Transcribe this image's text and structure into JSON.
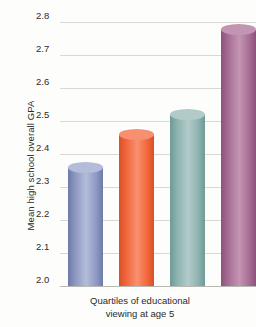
{
  "chart_data": {
    "type": "bar",
    "title": "",
    "xlabel": "Quartiles of educational viewing at age 5",
    "xlabel_line1": "Quartiles of educational",
    "xlabel_line2": "viewing at age 5",
    "ylabel": "Mean high school overall GPA",
    "categories": [
      "1",
      "2",
      "3",
      "4"
    ],
    "values": [
      2.36,
      2.46,
      2.52,
      2.78
    ],
    "ylim": [
      2.0,
      2.8
    ],
    "ytick_labels": [
      "2.8",
      "2.7",
      "2.6",
      "2.5",
      "2.4",
      "2.3",
      "2.2",
      "2.1",
      "2.0"
    ],
    "ytick_values": [
      2.8,
      2.7,
      2.6,
      2.5,
      2.4,
      2.3,
      2.2,
      2.1,
      2.0
    ],
    "grid": true,
    "legend": "none",
    "bar_colors": [
      "#8f9ac4",
      "#f2683c",
      "#8fb4b1",
      "#a96e95"
    ],
    "bar_colors_light": [
      "#b4bcd9",
      "#f79071",
      "#b2cbc9",
      "#c395b4"
    ],
    "bar_colors_dark": [
      "#6d7aa8",
      "#d9502a",
      "#6e9a96",
      "#8d5279"
    ]
  }
}
